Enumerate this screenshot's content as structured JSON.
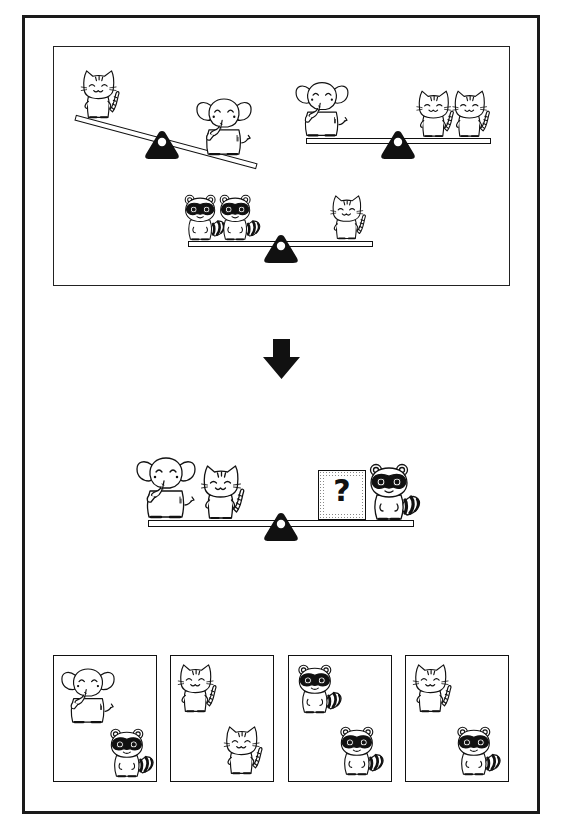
{
  "puzzle": {
    "type": "balance-scale-logic-puzzle",
    "premises": [
      {
        "id": "premise-1",
        "left": [
          "cat"
        ],
        "right": [
          "elephant"
        ],
        "state": "tilted-right-down",
        "meaning": "1 elephant heavier than 1 cat"
      },
      {
        "id": "premise-2",
        "left": [
          "elephant"
        ],
        "right": [
          "cat",
          "cat"
        ],
        "state": "balanced",
        "meaning": "1 elephant = 2 cats"
      },
      {
        "id": "premise-3",
        "left": [
          "raccoon",
          "raccoon"
        ],
        "right": [
          "cat"
        ],
        "state": "balanced",
        "meaning": "2 raccoons = 1 cat"
      }
    ],
    "arrow": "down-arrow",
    "question": {
      "left": [
        "elephant",
        "cat"
      ],
      "right": [
        "unknown",
        "raccoon"
      ],
      "state": "balanced",
      "unknown_label": "?"
    },
    "options": [
      {
        "index": 1,
        "top": "elephant",
        "bottom": "raccoon"
      },
      {
        "index": 2,
        "top": "cat",
        "bottom": "cat"
      },
      {
        "index": 3,
        "top": "raccoon",
        "bottom": "raccoon"
      },
      {
        "index": 4,
        "top": "cat",
        "bottom": "raccoon"
      }
    ]
  },
  "colors": {
    "ink": "#111111",
    "background": "#ffffff",
    "stipple": "#888888"
  }
}
